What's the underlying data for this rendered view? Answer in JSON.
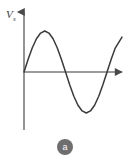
{
  "figure": {
    "caption_label": "a",
    "background_color": "#ffffff",
    "curve_color": "#3a3a3a",
    "axis_color": "#6b6b6b",
    "badge_color": "#6e6e6e",
    "badge_text_color": "#ffffff"
  },
  "axes": {
    "y_label_main": "V",
    "y_label_subscript": "s",
    "x_label": "",
    "origin_x": 24,
    "origin_y": 72,
    "y_axis_top": 10,
    "y_axis_bottom": 130,
    "x_axis_right": 126
  },
  "chart_data": {
    "type": "line",
    "title": "",
    "xlabel": "",
    "ylabel": "Vs",
    "grid": false,
    "legend": "none",
    "waveform": "sine",
    "xlim": [
      0,
      1.18
    ],
    "ylim": [
      -1.15,
      1.15
    ],
    "cycles": 1,
    "amplitude": 1,
    "key_points": [
      {
        "label": "start",
        "x": 0.0,
        "y": 0.0
      },
      {
        "label": "positive-peak",
        "x": 0.26,
        "y": 1.0
      },
      {
        "label": "zero-crossing-descending",
        "x": 0.51,
        "y": 0.0
      },
      {
        "label": "negative-trough",
        "x": 0.75,
        "y": -1.0
      },
      {
        "label": "zero-crossing-ascending",
        "x": 1.0,
        "y": 0.0
      },
      {
        "label": "end",
        "x": 1.18,
        "y": 0.72
      }
    ],
    "series": [
      {
        "name": "Vs",
        "x": [
          0.0,
          0.05,
          0.1,
          0.15,
          0.2,
          0.25,
          0.3,
          0.35,
          0.4,
          0.45,
          0.5,
          0.55,
          0.6,
          0.65,
          0.7,
          0.75,
          0.8,
          0.85,
          0.9,
          0.95,
          1.0,
          1.05,
          1.1,
          1.18
        ],
        "y": [
          0.0,
          0.31,
          0.59,
          0.81,
          0.95,
          1.0,
          0.95,
          0.81,
          0.59,
          0.31,
          0.0,
          -0.31,
          -0.59,
          -0.81,
          -0.95,
          -1.0,
          -0.95,
          -0.81,
          -0.59,
          -0.31,
          0.0,
          0.31,
          0.59,
          0.85
        ]
      }
    ]
  }
}
